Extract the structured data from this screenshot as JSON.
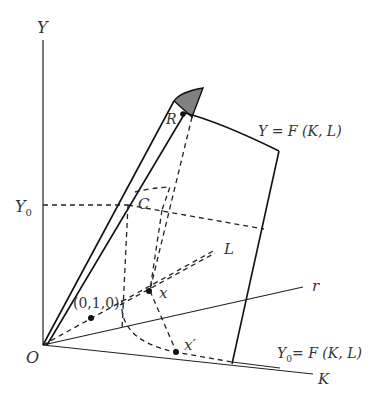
{
  "diagram": {
    "axes": {
      "y_label": "Y",
      "origin_label": "O",
      "k_label": "K",
      "l_label": "L",
      "r_label": "r",
      "y0_label": "Y",
      "y0_sub": "0"
    },
    "points": {
      "R": "R",
      "C": "C",
      "x": "x",
      "x_prime": "x′",
      "unit": "(0,1,0)"
    },
    "surfaces": {
      "production_function": "Y = F (K, L)",
      "isoquant_lhs": "Y",
      "isoquant_sub": "0",
      "isoquant_rhs": "= F (K, L)"
    },
    "colors": {
      "line": "#111111",
      "shade": "#808080",
      "text": "#333333"
    }
  }
}
